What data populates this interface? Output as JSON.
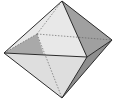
{
  "diagram": {
    "vertices": {
      "top": [
        62,
        1
      ],
      "bottom": [
        62,
        98
      ],
      "left": [
        4,
        53
      ],
      "right": [
        112,
        40
      ],
      "front": [
        87,
        57
      ],
      "back": [
        37,
        34
      ]
    },
    "colors": {
      "background": "#ffffff",
      "edge": "#2b2b2b",
      "hidden_edge": "#555555",
      "face_top_left": "#e6e6e6",
      "face_top_front": "#dcdcdc",
      "face_top_right": "#9a9a9a",
      "face_bottom_left": "#d4d4d4",
      "face_bottom_front": "#e2e2e2",
      "face_bottom_right": "#8c8c8c",
      "inner_back_shadow": "#a8a8a8"
    }
  }
}
